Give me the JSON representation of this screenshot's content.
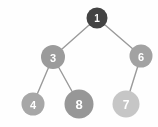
{
  "figure": {
    "kind": "binary-tree-graph",
    "background_color": "#fefefe",
    "width": 158,
    "height": 127
  },
  "chart_data": {
    "type": "diagram",
    "subtype": "node-link-tree",
    "title": "",
    "xlabel": "",
    "ylabel": "",
    "directed": false,
    "label_color": "#ffffff",
    "edge_color": "#9a9a9a",
    "edge_width": 1.4,
    "nodes": [
      {
        "id": "n1",
        "label": "1",
        "x": 97,
        "y": 18,
        "r": 10.5,
        "color": "#434343",
        "depth": 0
      },
      {
        "id": "n3",
        "label": "3",
        "x": 53,
        "y": 57,
        "r": 12.0,
        "color": "#9b9b9b",
        "depth": 1
      },
      {
        "id": "n6",
        "label": "6",
        "x": 141,
        "y": 56,
        "r": 11.5,
        "color": "#a2a2a2",
        "depth": 1
      },
      {
        "id": "n4",
        "label": "4",
        "x": 33,
        "y": 104,
        "r": 11.5,
        "color": "#a7a7a7",
        "depth": 2
      },
      {
        "id": "n8",
        "label": "8",
        "x": 79,
        "y": 104,
        "r": 14.5,
        "color": "#979797",
        "depth": 2
      },
      {
        "id": "n7",
        "label": "7",
        "x": 126,
        "y": 104,
        "r": 13.5,
        "color": "#c6c6c6",
        "depth": 2
      }
    ],
    "edges": [
      {
        "id": "e1",
        "source": "n1",
        "target": "n3"
      },
      {
        "id": "e2",
        "source": "n1",
        "target": "n6"
      },
      {
        "id": "e3",
        "source": "n3",
        "target": "n4"
      },
      {
        "id": "e4",
        "source": "n3",
        "target": "n8"
      },
      {
        "id": "e5",
        "source": "n6",
        "target": "n7"
      }
    ]
  }
}
